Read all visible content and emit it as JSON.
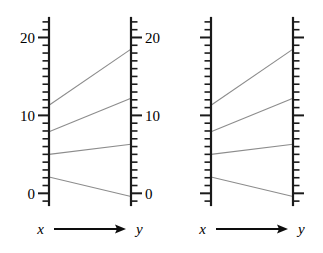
{
  "figure": {
    "background": "#ffffff",
    "axis_color": "#1a1a1a",
    "line_color": "#8c8c8c"
  },
  "panels": [
    {
      "name": "left-panel",
      "labeled": true,
      "x_axis": {
        "label": "x",
        "tick_labels": [
          "20",
          "10",
          "0"
        ],
        "tick_values": [
          20,
          10,
          0
        ],
        "min": -1.5,
        "max": 22.5,
        "minor_step": 1
      },
      "y_axis": {
        "label": "y",
        "tick_labels": [
          "20",
          "10",
          "0"
        ],
        "tick_values": [
          20,
          10,
          0
        ],
        "min": -1.5,
        "max": 22.5,
        "minor_step": 1
      },
      "arrow_label_left": "x",
      "arrow_label_right": "y"
    },
    {
      "name": "right-panel",
      "labeled": false,
      "x_axis": {
        "label": "x",
        "tick_labels": [],
        "tick_values": [
          20,
          10,
          0
        ],
        "min": -1.5,
        "max": 22.5,
        "minor_step": 1
      },
      "y_axis": {
        "label": "y",
        "tick_labels": [],
        "tick_values": [
          20,
          10,
          0
        ],
        "min": -1.5,
        "max": 22.5,
        "minor_step": 1
      },
      "arrow_label_left": "x",
      "arrow_label_right": "y"
    }
  ],
  "chart_data": {
    "type": "line",
    "title": "",
    "subtitle": "",
    "xlabel": "x",
    "ylabel": "y",
    "ylim": [
      -1.5,
      22.5
    ],
    "grid": false,
    "legend": "none",
    "axes": {
      "left_axis_name": "x",
      "right_axis_name": "y",
      "ticks_major": [
        0,
        10,
        20
      ],
      "tick_minor_step": 1,
      "range": [
        -1.5,
        22.5
      ]
    },
    "series": [
      {
        "name": "segment-1",
        "x": 11.3,
        "y": 18.5
      },
      {
        "name": "segment-2",
        "x": 7.9,
        "y": 12.2
      },
      {
        "name": "segment-3",
        "x": 5.0,
        "y": 6.3
      },
      {
        "name": "segment-4",
        "x": 2.1,
        "y": -0.4
      }
    ],
    "categories": [
      "segment-1",
      "segment-2",
      "segment-3",
      "segment-4"
    ],
    "values": [
      11.3,
      7.9,
      5.0,
      2.1
    ],
    "values_right": [
      18.5,
      12.2,
      6.3,
      -0.4
    ]
  }
}
